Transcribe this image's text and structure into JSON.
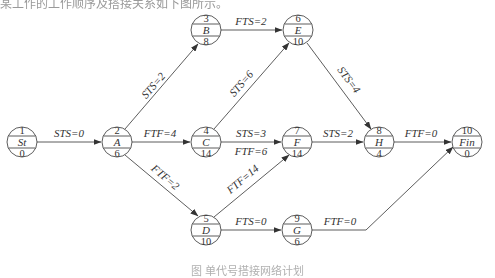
{
  "header": {
    "text": "某工作的工作顺序及搭接关系如下图所示。"
  },
  "caption": {
    "text": "图 单代号搭接网络计划"
  },
  "nodes": {
    "St": {
      "id": "1",
      "name": "St",
      "duration": "0",
      "x": 22,
      "y": 142
    },
    "A": {
      "id": "2",
      "name": "A",
      "duration": "6",
      "x": 117,
      "y": 142
    },
    "B": {
      "id": "3",
      "name": "B",
      "duration": "8",
      "x": 206,
      "y": 30
    },
    "C": {
      "id": "4",
      "name": "C",
      "duration": "14",
      "x": 206,
      "y": 142
    },
    "D": {
      "id": "5",
      "name": "D",
      "duration": "10",
      "x": 206,
      "y": 230
    },
    "E": {
      "id": "6",
      "name": "E",
      "duration": "10",
      "x": 298,
      "y": 30
    },
    "F": {
      "id": "7",
      "name": "F",
      "duration": "14",
      "x": 297,
      "y": 142
    },
    "H": {
      "id": "8",
      "name": "H",
      "duration": "4",
      "x": 379,
      "y": 142
    },
    "G": {
      "id": "9",
      "name": "G",
      "duration": "6",
      "x": 297,
      "y": 230
    },
    "Fin": {
      "id": "10",
      "name": "Fin",
      "duration": "0",
      "x": 467,
      "y": 142
    }
  },
  "edges": {
    "St_A": {
      "label": "STS=0"
    },
    "A_B": {
      "label": "STS=2"
    },
    "A_C": {
      "label": "FTF=4"
    },
    "A_D": {
      "label": "FTF=2"
    },
    "B_E": {
      "label": "FTS=2"
    },
    "C_E": {
      "label": "STS=6"
    },
    "C_F_1": {
      "label": "STS=3"
    },
    "C_F_2": {
      "label": "FTF=6"
    },
    "D_F": {
      "label": "FTF=14"
    },
    "E_H": {
      "label": "STS=4"
    },
    "F_H": {
      "label": "STS=2"
    },
    "D_G": {
      "label": "FTS=0"
    },
    "H_Fin": {
      "label": "FTF=0"
    },
    "G_Fin": {
      "label": "FTF=0"
    }
  },
  "colors": {
    "line": "#333333",
    "background": "#ffffff"
  }
}
